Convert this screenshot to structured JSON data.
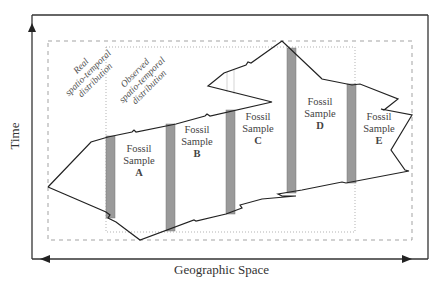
{
  "diagram": {
    "axes": {
      "x_label": "Geographic Space",
      "y_label": "Time"
    },
    "regions": {
      "real": "Real spatio-temporal distribution",
      "real_lines": [
        "Real",
        "spatio-temporal",
        "distribution"
      ],
      "observed": "Observed spatio-temporal distribution",
      "observed_lines": [
        "Observed",
        "spatio-temporal",
        "distribution"
      ]
    },
    "samples": [
      {
        "line1": "Fossil",
        "line2": "Sample",
        "id": "A"
      },
      {
        "line1": "Fossil",
        "line2": "Sample",
        "id": "B"
      },
      {
        "line1": "Fossil",
        "line2": "Sample",
        "id": "C"
      },
      {
        "line1": "Fossil",
        "line2": "Sample",
        "id": "D"
      },
      {
        "line1": "Fossil",
        "line2": "Sample",
        "id": "E"
      }
    ],
    "colors": {
      "line": "#222222",
      "sample_bar": "#9a9a9a",
      "dashed_box": "#999999",
      "dotted_box": "#aaaaaa"
    }
  }
}
